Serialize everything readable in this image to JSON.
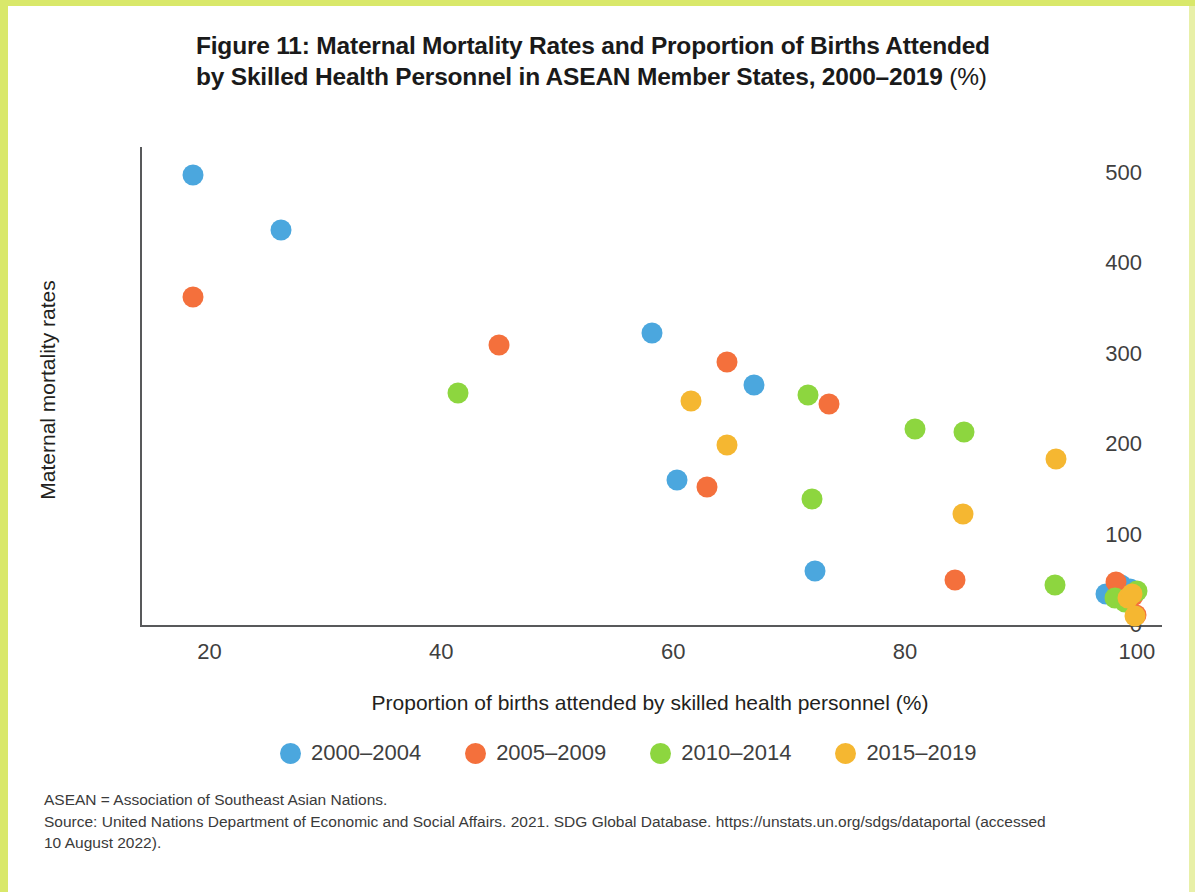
{
  "figure": {
    "title_line1": "Figure 11: Maternal Mortality Rates and Proportion of Births Attended",
    "title_line2": "by Skilled Health Personnel in ASEAN Member States, 2000–2019 ",
    "title_pct": "(%)"
  },
  "notes": {
    "line1": "ASEAN = Association of Southeast Asian Nations.",
    "line2": "Source: United Nations Department of Economic and Social Affairs. 2021. SDG Global Database. https://unstats.un.org/sdgs/dataportal (accessed",
    "line3": "10 August 2022)."
  },
  "chart_data": {
    "type": "scatter",
    "title": "Figure 11: Maternal Mortality Rates and Proportion of Births Attended by Skilled Health Personnel in ASEAN Member States, 2000–2019 (%)",
    "xlabel": "Proportion of births attended by skilled health personnel (%)",
    "ylabel": "Maternal mortality rates",
    "xlim": [
      14,
      102
    ],
    "ylim": [
      0,
      520
    ],
    "xticks": [
      20,
      40,
      60,
      80,
      100
    ],
    "yticks": [
      0,
      100,
      200,
      300,
      400,
      500
    ],
    "grid": false,
    "legend_position": "bottom",
    "series": [
      {
        "name": "2000–2004",
        "color": "#4ba7de",
        "points": [
          {
            "x": 18.6,
            "y": 498
          },
          {
            "x": 26.2,
            "y": 437
          },
          {
            "x": 58.2,
            "y": 323
          },
          {
            "x": 67.0,
            "y": 265
          },
          {
            "x": 60.3,
            "y": 160
          },
          {
            "x": 72.2,
            "y": 60
          },
          {
            "x": 97.3,
            "y": 34
          },
          {
            "x": 98.6,
            "y": 44
          },
          {
            "x": 99.4,
            "y": 40
          }
        ]
      },
      {
        "name": "2005–2009",
        "color": "#f4703c",
        "points": [
          {
            "x": 18.6,
            "y": 363
          },
          {
            "x": 45.0,
            "y": 310
          },
          {
            "x": 64.6,
            "y": 291
          },
          {
            "x": 73.4,
            "y": 244
          },
          {
            "x": 62.9,
            "y": 153
          },
          {
            "x": 84.3,
            "y": 50
          },
          {
            "x": 98.2,
            "y": 48
          },
          {
            "x": 99.7,
            "y": 32
          },
          {
            "x": 99.9,
            "y": 11
          }
        ]
      },
      {
        "name": "2010–2014",
        "color": "#8dd63f",
        "points": [
          {
            "x": 41.4,
            "y": 257
          },
          {
            "x": 71.6,
            "y": 254
          },
          {
            "x": 80.9,
            "y": 217
          },
          {
            "x": 85.1,
            "y": 213
          },
          {
            "x": 72.0,
            "y": 139
          },
          {
            "x": 92.9,
            "y": 44
          },
          {
            "x": 98.1,
            "y": 30
          },
          {
            "x": 99.0,
            "y": 26
          },
          {
            "x": 100.0,
            "y": 38
          }
        ]
      },
      {
        "name": "2015–2019",
        "color": "#f5b731",
        "points": [
          {
            "x": 61.5,
            "y": 248
          },
          {
            "x": 64.6,
            "y": 199
          },
          {
            "x": 93.0,
            "y": 184
          },
          {
            "x": 85.0,
            "y": 123
          },
          {
            "x": 99.2,
            "y": 30
          },
          {
            "x": 99.6,
            "y": 34
          },
          {
            "x": 99.8,
            "y": 10
          }
        ]
      }
    ]
  },
  "legend": [
    {
      "label": "2000–2004",
      "color": "#4ba7de"
    },
    {
      "label": "2005–2009",
      "color": "#f4703c"
    },
    {
      "label": "2010–2014",
      "color": "#8dd63f"
    },
    {
      "label": "2015–2019",
      "color": "#f5b731"
    }
  ]
}
